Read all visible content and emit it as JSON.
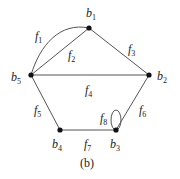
{
  "figure": {
    "caption": "(b)",
    "colors": {
      "edge": "#555555",
      "node": "#111111",
      "text": "#222222"
    }
  },
  "nodes": [
    {
      "id": "b1",
      "base": "b",
      "sub": "1",
      "x": 89,
      "y": 28,
      "label_x": 86,
      "label_y": 17
    },
    {
      "id": "b2",
      "base": "b",
      "sub": "2",
      "x": 149,
      "y": 75,
      "label_x": 157,
      "label_y": 80
    },
    {
      "id": "b3",
      "base": "b",
      "sub": "3",
      "x": 116,
      "y": 130,
      "label_x": 110,
      "label_y": 148
    },
    {
      "id": "b4",
      "base": "b",
      "sub": "4",
      "x": 60,
      "y": 130,
      "label_x": 52,
      "label_y": 148
    },
    {
      "id": "b5",
      "base": "b",
      "sub": "5",
      "x": 31,
      "y": 75,
      "label_x": 11,
      "label_y": 81
    }
  ],
  "edges": [
    {
      "id": "f1",
      "base": "f",
      "sub": "1",
      "from": "b5",
      "to": "b1",
      "shape": "curve",
      "label_x": 35,
      "label_y": 40
    },
    {
      "id": "f2",
      "base": "f",
      "sub": "2",
      "from": "b5",
      "to": "b1",
      "shape": "line",
      "label_x": 68,
      "label_y": 59
    },
    {
      "id": "f3",
      "base": "f",
      "sub": "3",
      "from": "b1",
      "to": "b2",
      "shape": "line",
      "label_x": 128,
      "label_y": 53
    },
    {
      "id": "f4",
      "base": "f",
      "sub": "4",
      "from": "b5",
      "to": "b2",
      "shape": "line",
      "label_x": 85,
      "label_y": 94
    },
    {
      "id": "f5",
      "base": "f",
      "sub": "5",
      "from": "b5",
      "to": "b4",
      "shape": "line",
      "label_x": 34,
      "label_y": 114
    },
    {
      "id": "f6",
      "base": "f",
      "sub": "6",
      "from": "b2",
      "to": "b3",
      "shape": "line",
      "label_x": 139,
      "label_y": 114
    },
    {
      "id": "f7",
      "base": "f",
      "sub": "7",
      "from": "b4",
      "to": "b3",
      "shape": "line",
      "label_x": 84,
      "label_y": 148
    },
    {
      "id": "f8",
      "base": "f",
      "sub": "8",
      "from": "b3",
      "to": "b3",
      "shape": "loop",
      "label_x": 100,
      "label_y": 122
    }
  ]
}
